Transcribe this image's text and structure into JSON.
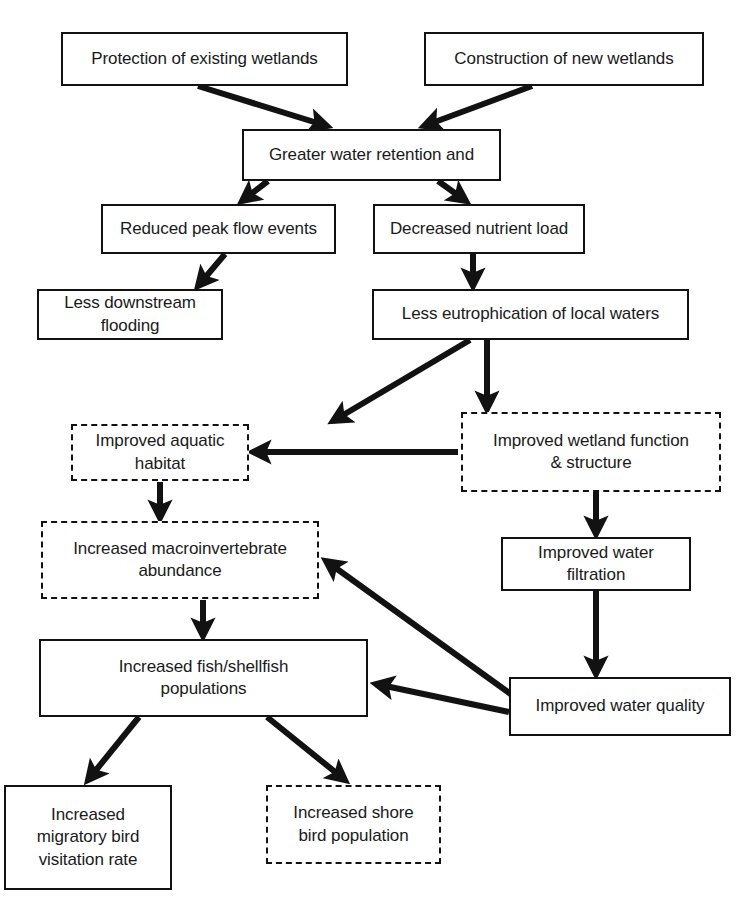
{
  "diagram": {
    "background_color": "#ffffff",
    "line_color": "#121212",
    "text_color": "#1a1a1a",
    "nodes": [
      {
        "id": "protection",
        "label": "Protection of existing wetlands",
        "style": "solid",
        "x": 61,
        "y": 32,
        "w": 287,
        "h": 54
      },
      {
        "id": "construction",
        "label": "Construction of new wetlands",
        "style": "solid",
        "x": 424,
        "y": 32,
        "w": 280,
        "h": 54
      },
      {
        "id": "retention",
        "label": "Greater water retention and",
        "style": "solid",
        "x": 242,
        "y": 129,
        "w": 259,
        "h": 52
      },
      {
        "id": "peak_flow",
        "label": "Reduced peak flow events",
        "style": "solid",
        "x": 101,
        "y": 204,
        "w": 235,
        "h": 50
      },
      {
        "id": "nutrient_load",
        "label": "Decreased nutrient load",
        "style": "solid",
        "x": 373,
        "y": 204,
        "w": 212,
        "h": 50
      },
      {
        "id": "flooding",
        "label": "Less downstream flooding",
        "style": "solid",
        "x": 37,
        "y": 289,
        "w": 186,
        "h": 51
      },
      {
        "id": "eutrophication",
        "label": "Less eutrophication of local waters",
        "style": "solid",
        "x": 372,
        "y": 289,
        "w": 317,
        "h": 51
      },
      {
        "id": "aquatic_habitat",
        "label": "Improved aquatic habitat",
        "style": "dashed",
        "x": 71,
        "y": 424,
        "w": 178,
        "h": 57
      },
      {
        "id": "wetland_function",
        "label": "Improved wetland function\n& structure",
        "style": "dashed",
        "x": 461,
        "y": 412,
        "w": 260,
        "h": 80
      },
      {
        "id": "macroinvertebrate",
        "label": "Increased macroinvertebrate\nabundance",
        "style": "dashed",
        "x": 41,
        "y": 521,
        "w": 278,
        "h": 78
      },
      {
        "id": "water_filtration",
        "label": "Improved water filtration",
        "style": "solid",
        "x": 501,
        "y": 537,
        "w": 190,
        "h": 54
      },
      {
        "id": "fish_shellfish",
        "label": "Increased fish/shellfish\npopulations",
        "style": "solid",
        "x": 39,
        "y": 639,
        "w": 329,
        "h": 78
      },
      {
        "id": "water_quality",
        "label": "Improved water quality",
        "style": "solid",
        "x": 509,
        "y": 677,
        "w": 222,
        "h": 59
      },
      {
        "id": "migratory_bird",
        "label": "Increased\nmigratory bird\nvisitation rate",
        "style": "solid",
        "x": 4,
        "y": 785,
        "w": 168,
        "h": 105
      },
      {
        "id": "shore_bird",
        "label": "Increased shore\nbird population",
        "style": "dashed",
        "x": 266,
        "y": 785,
        "w": 175,
        "h": 79
      }
    ],
    "edges": [
      {
        "id": "e1",
        "from": "protection",
        "to": "retention",
        "x1": 198,
        "y1": 86,
        "x2": 327,
        "y2": 126
      },
      {
        "id": "e2",
        "from": "construction",
        "to": "retention",
        "x1": 532,
        "y1": 86,
        "x2": 424,
        "y2": 126
      },
      {
        "id": "e3",
        "from": "retention",
        "to": "peak_flow",
        "x1": 268,
        "y1": 181,
        "x2": 242,
        "y2": 201
      },
      {
        "id": "e4",
        "from": "retention",
        "to": "nutrient_load",
        "x1": 438,
        "y1": 181,
        "x2": 466,
        "y2": 201
      },
      {
        "id": "e5",
        "from": "peak_flow",
        "to": "flooding",
        "x1": 225,
        "y1": 254,
        "x2": 198,
        "y2": 286
      },
      {
        "id": "e6",
        "from": "nutrient_load",
        "to": "eutrophication",
        "x1": 473,
        "y1": 254,
        "x2": 473,
        "y2": 286
      },
      {
        "id": "e7",
        "from": "eutrophication",
        "to": "aquatic_habitat",
        "x1": 470,
        "y1": 340,
        "x2": 333,
        "y2": 421
      },
      {
        "id": "e8",
        "from": "eutrophication",
        "to": "wetland_function",
        "x1": 487,
        "y1": 340,
        "x2": 487,
        "y2": 409
      },
      {
        "id": "e9",
        "from": "wetland_function",
        "to": "aquatic_habitat",
        "x1": 458,
        "y1": 452,
        "x2": 253,
        "y2": 452
      },
      {
        "id": "e10",
        "from": "aquatic_habitat",
        "to": "macroinvertebrate",
        "x1": 160,
        "y1": 482,
        "x2": 160,
        "y2": 518
      },
      {
        "id": "e11",
        "from": "wetland_function",
        "to": "water_filtration",
        "x1": 596,
        "y1": 492,
        "x2": 596,
        "y2": 534
      },
      {
        "id": "e12",
        "from": "macroinvertebrate",
        "to": "fish_shellfish",
        "x1": 203,
        "y1": 600,
        "x2": 203,
        "y2": 636
      },
      {
        "id": "e13",
        "from": "water_filtration",
        "to": "water_quality",
        "x1": 596,
        "y1": 591,
        "x2": 596,
        "y2": 674
      },
      {
        "id": "e14",
        "from": "water_quality",
        "to": "macroinvertebrate",
        "x1": 519,
        "y1": 700,
        "x2": 326,
        "y2": 561
      },
      {
        "id": "e15",
        "from": "water_quality",
        "to": "fish_shellfish",
        "x1": 509,
        "y1": 712,
        "x2": 376,
        "y2": 684
      },
      {
        "id": "e16",
        "from": "fish_shellfish",
        "to": "migratory_bird",
        "x1": 139,
        "y1": 717,
        "x2": 88,
        "y2": 780
      },
      {
        "id": "e17",
        "from": "fish_shellfish",
        "to": "shore_bird",
        "x1": 267,
        "y1": 717,
        "x2": 345,
        "y2": 780
      }
    ]
  }
}
